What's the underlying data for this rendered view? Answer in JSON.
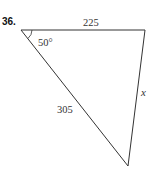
{
  "problem_number": "36.",
  "triangle": {
    "side_top": "225",
    "side_left": "305",
    "side_right": "x",
    "angle_top_left": "50°"
  },
  "colors": {
    "stroke": "#333333",
    "text": "#333333"
  }
}
